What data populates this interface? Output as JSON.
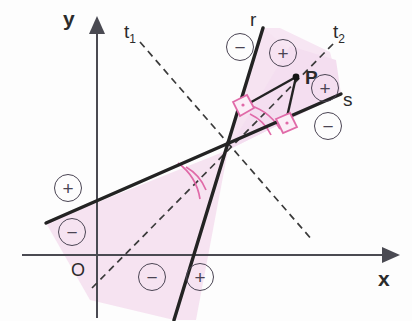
{
  "figure": {
    "background": "#fdfdfd",
    "colors": {
      "axis": "#4a4a52",
      "line": "#232323",
      "dashed": "#3a3a3a",
      "shade": "#f7e6f3",
      "angle_arc": "#e06aa8",
      "right_angle": "#e06aa8",
      "sign_stroke": "#4a4453",
      "text": "#2b2b2b"
    }
  },
  "axes": {
    "x_label": "x",
    "y_label": "y",
    "origin_label": "O",
    "x_axis_y": 255,
    "y_axis_x": 97
  },
  "lines": [
    {
      "id": "r",
      "label": "r",
      "type": "solid",
      "x1": 263,
      "y1": 28,
      "x2": 174,
      "y2": 320
    },
    {
      "id": "s",
      "label": "s",
      "type": "solid",
      "x1": 46,
      "y1": 223,
      "x2": 341,
      "y2": 94
    },
    {
      "id": "t1",
      "label": "t",
      "sub": "1",
      "type": "dashed",
      "x1": 140,
      "y1": 42,
      "x2": 313,
      "y2": 241
    },
    {
      "id": "t2",
      "label": "t",
      "sub": "2",
      "type": "dashed",
      "x1": 92,
      "y1": 288,
      "x2": 336,
      "y2": 41
    }
  ],
  "points": [
    {
      "id": "P",
      "label": "P",
      "x": 296,
      "y": 77
    },
    {
      "id": "I",
      "label": "",
      "x": 228,
      "y": 150
    }
  ],
  "perpendicular_feet": [
    {
      "from": "P",
      "to": "r",
      "x": 237,
      "y": 110
    },
    {
      "from": "P",
      "to": "s",
      "x": 285,
      "y": 126
    }
  ],
  "labels": [
    {
      "name": "label-r",
      "text": "r",
      "x": 250,
      "y": 10
    },
    {
      "name": "label-s",
      "text": "s",
      "x": 343,
      "y": 90
    },
    {
      "name": "label-t1",
      "text": "t",
      "sub": "1",
      "x": 124,
      "y": 22
    },
    {
      "name": "label-t2",
      "text": "t",
      "sub": "2",
      "x": 333,
      "y": 22
    },
    {
      "name": "label-y",
      "text": "y",
      "x": 63,
      "y": 8
    },
    {
      "name": "label-x",
      "text": "x",
      "x": 378,
      "y": 268
    },
    {
      "name": "label-origin",
      "text": "O",
      "x": 71,
      "y": 261
    },
    {
      "name": "label-P",
      "text": "P",
      "x": 305,
      "y": 68
    }
  ],
  "signs": [
    {
      "name": "sign-top-minus",
      "symbol": "−",
      "x": 226,
      "y": 33
    },
    {
      "name": "sign-top-plus",
      "symbol": "+",
      "x": 269,
      "y": 39
    },
    {
      "name": "sign-right-plus",
      "symbol": "+",
      "x": 311,
      "y": 74
    },
    {
      "name": "sign-right-minus",
      "symbol": "−",
      "x": 314,
      "y": 112
    },
    {
      "name": "sign-left-plus",
      "symbol": "+",
      "x": 54,
      "y": 174
    },
    {
      "name": "sign-left-minus",
      "symbol": "−",
      "x": 58,
      "y": 218
    },
    {
      "name": "sign-bottom-minus",
      "symbol": "−",
      "x": 138,
      "y": 263
    },
    {
      "name": "sign-bottom-plus",
      "symbol": "+",
      "x": 186,
      "y": 263
    }
  ],
  "shaded_regions": [
    {
      "name": "wedge-upper-right",
      "description": "vertical angle containing P bounded by r and s"
    },
    {
      "name": "wedge-lower-left",
      "description": "opposite vertical angle bounded by r and s"
    }
  ],
  "angle_arcs": [
    {
      "name": "arc-upper",
      "description": "angle between r and s above intersection"
    },
    {
      "name": "arc-lower",
      "description": "angle between r and s below intersection"
    }
  ]
}
